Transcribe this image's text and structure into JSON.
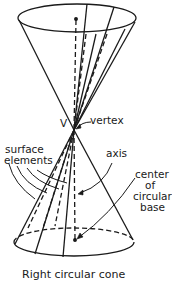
{
  "figure": {
    "caption": "Right circular cone",
    "labels": {
      "vertex_letter": "V",
      "vertex": "vertex",
      "surface_line1": "surface",
      "surface_line2": "elements",
      "axis": "axis",
      "center_line1": "center",
      "center_line2": "of",
      "center_line3": "circular",
      "center_line4": "base"
    },
    "colors": {
      "ink": "#1a1a1a",
      "background": "#ffffff"
    }
  }
}
